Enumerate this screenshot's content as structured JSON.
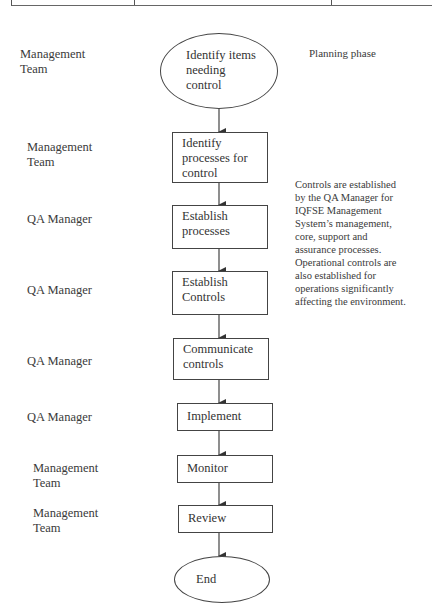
{
  "diagram": {
    "type": "flowchart",
    "note_top": "Planning phase",
    "side_note": "Controls are established by the QA Manager for IQFSE Management System's management, core, support and assurance processes. Operational controls are also established for operations significantly affecting the environment.",
    "side_note_lines": [
      "Controls are established",
      "by the QA Manager for",
      "IQFSE Management",
      "System’s management,",
      "core, support and",
      "assurance processes.",
      "Operational controls are",
      "also established for",
      "operations significantly",
      "affecting the environment."
    ],
    "steps": [
      {
        "shape": "ellipse",
        "label_lines": [
          "Identify items",
          "needing",
          "control"
        ],
        "role_lines": [
          "Management",
          "Team"
        ]
      },
      {
        "shape": "box",
        "label_lines": [
          "Identify",
          "processes for",
          "control"
        ],
        "role_lines": [
          "Management",
          "Team"
        ]
      },
      {
        "shape": "box",
        "label_lines": [
          "Establish",
          "processes"
        ],
        "role_lines": [
          "QA Manager"
        ]
      },
      {
        "shape": "box",
        "label_lines": [
          "Establish",
          "Controls"
        ],
        "role_lines": [
          "QA Manager"
        ]
      },
      {
        "shape": "box",
        "label_lines": [
          "Communicate",
          "controls"
        ],
        "role_lines": [
          "QA Manager"
        ]
      },
      {
        "shape": "box",
        "label_lines": [
          "Implement"
        ],
        "role_lines": [
          "QA Manager"
        ]
      },
      {
        "shape": "box",
        "label_lines": [
          "Monitor"
        ],
        "role_lines": [
          "Management",
          "Team"
        ]
      },
      {
        "shape": "box",
        "label_lines": [
          "Review"
        ],
        "role_lines": [
          "Management",
          "Team"
        ]
      },
      {
        "shape": "ellipse",
        "label_lines": [
          "End"
        ],
        "role_lines": []
      }
    ],
    "colors": {
      "line": "#444444",
      "text": "#333333",
      "background": "#ffffff"
    }
  }
}
